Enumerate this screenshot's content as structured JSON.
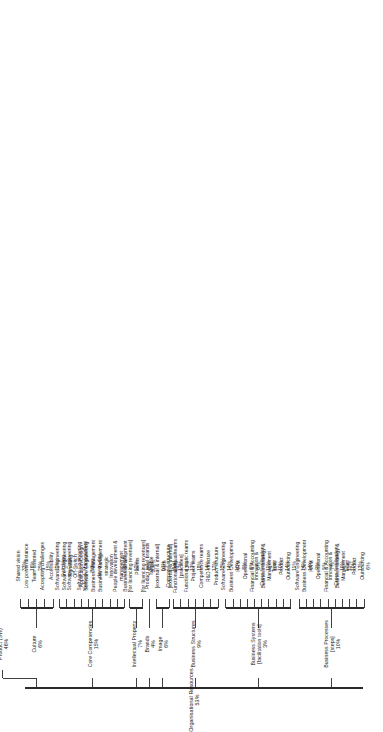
{
  "diagram": {
    "title": "Organisational Resources",
    "orientation": "rotated-90",
    "root": {
      "label": "Organisational Resources",
      "value": "53%"
    },
    "branches": [
      {
        "label": "Culture",
        "value": "6%",
        "sibling": {
          "label": "Product (SW)",
          "value": "46%"
        },
        "leaves": [
          {
            "label": "Shared vision",
            "value": "33%"
          },
          {
            "label": "Low power/distance",
            "value": "16%"
          },
          {
            "label": "Team oriented",
            "value": "25%"
          },
          {
            "label": "Accepting challenges",
            "value": "15%"
          },
          {
            "label": "Accessibility",
            "value": "11%"
          }
        ]
      },
      {
        "label": "Core Competencies",
        "value": "15%",
        "leaves": [
          {
            "label": "Software Engineering\nSwitching",
            "value": ""
          },
          {
            "label": "Software Engineering\nSignalling",
            "value": ""
          },
          {
            "label": "Software Engineering\nOff-Switch\nApplication Design",
            "value": ""
          },
          {
            "label": "Software Engineering\nNetwork Management",
            "value": ""
          },
          {
            "label": "Software Engineering\nBilling",
            "value": ""
          },
          {
            "label": "Business Management\nday-to-day",
            "value": ""
          },
          {
            "label": "Business Management\nstrategic",
            "value": ""
          },
          {
            "label": "Innovation",
            "value": ""
          },
          {
            "label": "People development &\nmanagement",
            "value": ""
          },
          {
            "label": "Business development",
            "value": ""
          }
        ]
      },
      {
        "label": "Intellectual Property",
        "value": "7%",
        "leaves": [
          {
            "label": "Copyright\n[for licencing revenues]",
            "value": "52%"
          },
          {
            "label": "Patents\n[for licencing revenues]",
            "value": "48%"
          }
        ]
      },
      {
        "label": "Brands",
        "value": "4%",
        "leaves": [
          {
            "label": "Product level brands",
            "value": "100%"
          }
        ]
      },
      {
        "label": "Image",
        "value": "6%",
        "leaves": [
          {
            "label": "Tangible\n[external & internal]",
            "value": "51%"
          },
          {
            "label": "Myth\n[external & internal]",
            "value": "49%"
          }
        ]
      },
      {
        "label": "Business Structures",
        "value": "9%",
        "leaves": [
          {
            "label": "Company structure\n[flat]",
            "value": "17%"
          },
          {
            "label": "Functional virtual/teams\n[practices]",
            "value": "13%"
          },
          {
            "label": "Functional static teams",
            "value": "13%"
          },
          {
            "label": "Project teams",
            "value": "18%"
          },
          {
            "label": "Competence teams",
            "value": "14%"
          },
          {
            "label": "R&D structure",
            "value": "12%"
          },
          {
            "label": "Product structure",
            "value": "12%"
          }
        ]
      },
      {
        "label": "Business Systems\n[facilitation tools]",
        "value": "3%",
        "leaves": [
          {
            "label": "Software Engineering",
            "value": "14%"
          },
          {
            "label": "Business Development",
            "value": "10%"
          },
          {
            "label": "HRM",
            "value": "8%"
          },
          {
            "label": "Operational",
            "value": "6%"
          },
          {
            "label": "Financial & Accounting",
            "value": "6%"
          },
          {
            "label": "Innovation &\nCross fertilisation",
            "value": "11%"
          },
          {
            "label": "Business strategy &\nManagement",
            "value": "10%"
          },
          {
            "label": "Team",
            "value": "10%"
          },
          {
            "label": "Product",
            "value": "14%"
          },
          {
            "label": "Outsourcing",
            "value": "11%"
          }
        ]
      },
      {
        "label": "Business Processes\n[steps]",
        "value": "10%",
        "leaves": [
          {
            "label": "Software Engineering",
            "value": "14%"
          },
          {
            "label": "Business Development",
            "value": "14%"
          },
          {
            "label": "HRM",
            "value": "9%"
          },
          {
            "label": "Operational",
            "value": "5%"
          },
          {
            "label": "Financial & Accounting",
            "value": "7%"
          },
          {
            "label": "Innovation &\nCross fertilisation",
            "value": "10%"
          },
          {
            "label": "Business strategy &\nManagement",
            "value": "11%"
          },
          {
            "label": "Team",
            "value": "10%"
          },
          {
            "label": "Product",
            "value": "13%"
          },
          {
            "label": "Outsourcing",
            "value": "6%"
          }
        ]
      }
    ]
  }
}
